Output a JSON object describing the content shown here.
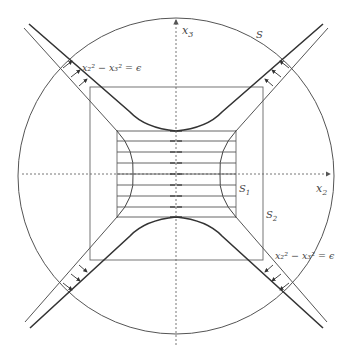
{
  "figure": {
    "labels": {
      "x3_axis": "x",
      "x3_sub": "3",
      "x2_axis": "x",
      "x2_sub": "2",
      "sphere": "S",
      "s1": "S",
      "s1_sub": "1",
      "s2": "S",
      "s2_sub": "2",
      "hyperbola_top": "x₂² − x₃² = ϵ",
      "hyperbola_bottom": "x₂² − x₃² = ϵ"
    },
    "colors": {
      "stroke": "#555555",
      "thick": "#333333",
      "axis": "#666666",
      "background": "#ffffff"
    },
    "geometry": {
      "circle": {
        "cx": 176,
        "cy": 176,
        "r": 158
      },
      "square_outer": {
        "x": 90,
        "y": 87,
        "w": 173,
        "h": 173
      },
      "square_inner": {
        "x": 117,
        "y": 130,
        "w": 119,
        "h": 87
      },
      "flow_lines_y": [
        131,
        141,
        152,
        163,
        174,
        185,
        196,
        207,
        217
      ]
    }
  }
}
